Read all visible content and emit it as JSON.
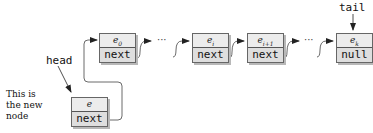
{
  "diagram": {
    "type": "linked-list-insert-at-head",
    "labels": {
      "head": "head",
      "tail": "tail",
      "note_lines": [
        "This is",
        "the new",
        "node"
      ]
    },
    "nodes": [
      {
        "id": "e0",
        "value": "e",
        "sub": "0",
        "pointer": "next"
      },
      {
        "id": "ei",
        "value": "e",
        "sub": "i",
        "pointer": "next"
      },
      {
        "id": "ei1",
        "value": "e",
        "sub": "i+1",
        "pointer": "next"
      },
      {
        "id": "ek",
        "value": "e",
        "sub": "k",
        "pointer": "null"
      },
      {
        "id": "e_new",
        "value": "e",
        "sub": "",
        "pointer": "next"
      }
    ],
    "ellipsis": "···",
    "colors": {
      "node_fill": "#e4e4e4",
      "node_border": "#666666",
      "shadow": "#b8b8b8",
      "line": "#333333"
    }
  }
}
